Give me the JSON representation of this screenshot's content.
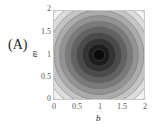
{
  "panel": {
    "label": "(A)"
  },
  "chart_data": {
    "type": "contour",
    "title": "",
    "xlabel": "b",
    "ylabel": "m",
    "xlim": [
      0,
      2
    ],
    "ylim": [
      0,
      2
    ],
    "xticks": [
      "0",
      "0.5",
      "1",
      "1.5",
      "2"
    ],
    "yticks": [
      "0",
      "0.5",
      "1",
      "1.5",
      "2"
    ],
    "grid": false,
    "legend": null,
    "center": {
      "b": 1,
      "m": 1
    },
    "contour_levels": 10,
    "colormap": [
      "#0a0a0a",
      "#1e1e1e",
      "#333333",
      "#4a4a4a",
      "#626262",
      "#7a7a7a",
      "#939393",
      "#ababab",
      "#c4c4c4",
      "#dcdcdc",
      "#f2f2f2"
    ]
  }
}
